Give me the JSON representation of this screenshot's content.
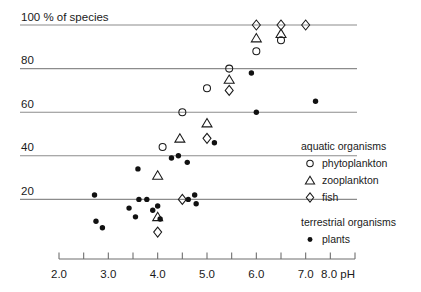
{
  "chart_data": {
    "type": "scatter",
    "title": "100 % of species",
    "xlabel": "pH",
    "ylabel": "% of species",
    "xlim": [
      2.0,
      8.0
    ],
    "ylim": [
      0,
      100
    ],
    "grid": true,
    "x_ticks_major": [
      "2.0",
      "3.0",
      "4.0",
      "5.0",
      "6.0",
      "7.0",
      "8.0"
    ],
    "x_tick_values_major": [
      2.0,
      3.0,
      4.0,
      5.0,
      6.0,
      7.0,
      8.0
    ],
    "x_tick_values_minor": [
      2.5,
      3.5,
      4.5,
      5.5,
      6.5,
      7.5
    ],
    "y_ticks": [
      "100",
      "80",
      "60",
      "40",
      "20"
    ],
    "y_tick_values": [
      100,
      80,
      60,
      40,
      20
    ],
    "x_axis_unit": "pH",
    "axis_end_label": "8.0 pH",
    "legend_position": "right-bottom",
    "legend": {
      "groups": [
        {
          "heading": "aquatic organisms",
          "entries": [
            {
              "marker": "circle-open",
              "label": "phytoplankton"
            },
            {
              "marker": "triangle-open",
              "label": "zooplankton"
            },
            {
              "marker": "diamond-open",
              "label": "fish"
            }
          ]
        },
        {
          "heading": "terrestrial organisms",
          "entries": [
            {
              "marker": "circle-filled",
              "label": "plants"
            }
          ]
        }
      ]
    },
    "series": [
      {
        "name": "phytoplankton",
        "marker": "circle-open",
        "points": [
          {
            "x": 4.5,
            "y": 60
          },
          {
            "x": 4.1,
            "y": 44
          },
          {
            "x": 5.0,
            "y": 71
          },
          {
            "x": 5.45,
            "y": 80
          },
          {
            "x": 6.0,
            "y": 88
          },
          {
            "x": 6.5,
            "y": 93
          }
        ]
      },
      {
        "name": "zooplankton",
        "marker": "triangle-open",
        "points": [
          {
            "x": 4.0,
            "y": 12
          },
          {
            "x": 4.0,
            "y": 31
          },
          {
            "x": 4.45,
            "y": 48
          },
          {
            "x": 5.0,
            "y": 55
          },
          {
            "x": 5.45,
            "y": 75
          },
          {
            "x": 6.0,
            "y": 94
          },
          {
            "x": 6.5,
            "y": 96
          }
        ]
      },
      {
        "name": "fish",
        "marker": "diamond-open",
        "points": [
          {
            "x": 4.0,
            "y": 5
          },
          {
            "x": 4.5,
            "y": 20
          },
          {
            "x": 5.0,
            "y": 48
          },
          {
            "x": 5.45,
            "y": 70
          },
          {
            "x": 6.0,
            "y": 100
          },
          {
            "x": 6.5,
            "y": 100
          },
          {
            "x": 7.0,
            "y": 100
          }
        ]
      },
      {
        "name": "plants",
        "marker": "circle-filled",
        "points": [
          {
            "x": 2.75,
            "y": 10
          },
          {
            "x": 2.88,
            "y": 7
          },
          {
            "x": 2.72,
            "y": 22
          },
          {
            "x": 3.42,
            "y": 16
          },
          {
            "x": 3.55,
            "y": 12
          },
          {
            "x": 3.62,
            "y": 20
          },
          {
            "x": 3.6,
            "y": 34
          },
          {
            "x": 3.78,
            "y": 20
          },
          {
            "x": 3.9,
            "y": 15
          },
          {
            "x": 4.0,
            "y": 17
          },
          {
            "x": 4.05,
            "y": 11
          },
          {
            "x": 4.28,
            "y": 39
          },
          {
            "x": 4.42,
            "y": 40
          },
          {
            "x": 4.62,
            "y": 20
          },
          {
            "x": 4.75,
            "y": 22
          },
          {
            "x": 4.78,
            "y": 18
          },
          {
            "x": 4.6,
            "y": 37
          },
          {
            "x": 5.15,
            "y": 46
          },
          {
            "x": 5.9,
            "y": 78
          },
          {
            "x": 6.0,
            "y": 60
          },
          {
            "x": 7.2,
            "y": 65
          }
        ]
      }
    ]
  }
}
